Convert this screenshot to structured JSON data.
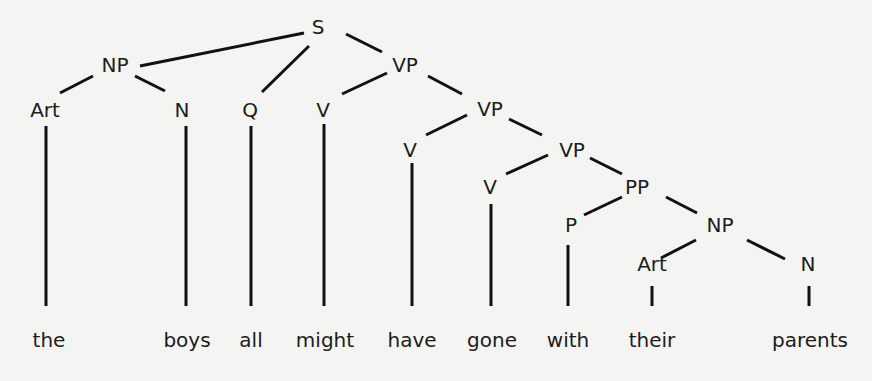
{
  "diagram": {
    "type": "syntax-tree",
    "sentence": "the boys all might have gone with their parents",
    "nodes": [
      {
        "id": "S",
        "label": "S",
        "x": 318,
        "y": 34
      },
      {
        "id": "NP1",
        "label": "NP",
        "x": 115,
        "y": 72
      },
      {
        "id": "VP1",
        "label": "VP",
        "x": 405,
        "y": 72
      },
      {
        "id": "Art1",
        "label": "Art",
        "x": 45,
        "y": 117
      },
      {
        "id": "N1",
        "label": "N",
        "x": 182,
        "y": 117
      },
      {
        "id": "Q",
        "label": "Q",
        "x": 250,
        "y": 117
      },
      {
        "id": "V1",
        "label": "V",
        "x": 323,
        "y": 117
      },
      {
        "id": "VP2",
        "label": "VP",
        "x": 490,
        "y": 116
      },
      {
        "id": "V2",
        "label": "V",
        "x": 410,
        "y": 157
      },
      {
        "id": "VP3",
        "label": "VP",
        "x": 572,
        "y": 157
      },
      {
        "id": "V3",
        "label": "V",
        "x": 490,
        "y": 194
      },
      {
        "id": "PP",
        "label": "PP",
        "x": 637,
        "y": 194
      },
      {
        "id": "P",
        "label": "P",
        "x": 571,
        "y": 232
      },
      {
        "id": "NP2",
        "label": "NP",
        "x": 720,
        "y": 232
      },
      {
        "id": "Art2",
        "label": "Art",
        "x": 652,
        "y": 271
      },
      {
        "id": "N2",
        "label": "N",
        "x": 808,
        "y": 271
      }
    ],
    "edges": [
      {
        "from": "S",
        "to": "NP1",
        "x1": 304,
        "y1": 33,
        "x2": 140,
        "y2": 66
      },
      {
        "from": "S",
        "to": "Q",
        "x1": 309,
        "y1": 46,
        "x2": 262,
        "y2": 92
      },
      {
        "from": "S",
        "to": "VP1",
        "x1": 346,
        "y1": 34,
        "x2": 382,
        "y2": 52
      },
      {
        "from": "NP1",
        "to": "Art1",
        "x1": 93,
        "y1": 76,
        "x2": 60,
        "y2": 93
      },
      {
        "from": "NP1",
        "to": "N1",
        "x1": 135,
        "y1": 76,
        "x2": 165,
        "y2": 91
      },
      {
        "from": "VP1",
        "to": "V1",
        "x1": 387,
        "y1": 73,
        "x2": 342,
        "y2": 94
      },
      {
        "from": "VP1",
        "to": "VP2",
        "x1": 428,
        "y1": 76,
        "x2": 462,
        "y2": 94
      },
      {
        "from": "VP2",
        "to": "V2",
        "x1": 467,
        "y1": 115,
        "x2": 426,
        "y2": 135
      },
      {
        "from": "VP2",
        "to": "VP3",
        "x1": 509,
        "y1": 119,
        "x2": 542,
        "y2": 135
      },
      {
        "from": "VP3",
        "to": "V3",
        "x1": 548,
        "y1": 155,
        "x2": 506,
        "y2": 174
      },
      {
        "from": "VP3",
        "to": "PP",
        "x1": 590,
        "y1": 158,
        "x2": 622,
        "y2": 174
      },
      {
        "from": "PP",
        "to": "P",
        "x1": 622,
        "y1": 197,
        "x2": 584,
        "y2": 215
      },
      {
        "from": "PP",
        "to": "NP2",
        "x1": 666,
        "y1": 197,
        "x2": 697,
        "y2": 213
      },
      {
        "from": "NP2",
        "to": "Art2",
        "x1": 696,
        "y1": 240,
        "x2": 661,
        "y2": 258
      },
      {
        "from": "NP2",
        "to": "N2",
        "x1": 747,
        "y1": 240,
        "x2": 785,
        "y2": 259
      },
      {
        "from": "Art1",
        "to": "the",
        "x1": 46,
        "y1": 126,
        "x2": 46,
        "y2": 306
      },
      {
        "from": "N1",
        "to": "boys",
        "x1": 186,
        "y1": 126,
        "x2": 186,
        "y2": 306
      },
      {
        "from": "Q",
        "to": "all",
        "x1": 251,
        "y1": 126,
        "x2": 251,
        "y2": 306
      },
      {
        "from": "V1",
        "to": "might",
        "x1": 324,
        "y1": 124,
        "x2": 324,
        "y2": 306
      },
      {
        "from": "V2",
        "to": "have",
        "x1": 412,
        "y1": 163,
        "x2": 412,
        "y2": 306
      },
      {
        "from": "V3",
        "to": "gone",
        "x1": 491,
        "y1": 204,
        "x2": 491,
        "y2": 306
      },
      {
        "from": "P",
        "to": "with",
        "x1": 568,
        "y1": 245,
        "x2": 568,
        "y2": 306
      },
      {
        "from": "Art2",
        "to": "their",
        "x1": 652,
        "y1": 286,
        "x2": 652,
        "y2": 306
      },
      {
        "from": "N2",
        "to": "parents",
        "x1": 809,
        "y1": 286,
        "x2": 809,
        "y2": 306
      }
    ],
    "words": [
      {
        "text": "the",
        "x": 49,
        "y": 347
      },
      {
        "text": "boys",
        "x": 187,
        "y": 347
      },
      {
        "text": "all",
        "x": 251,
        "y": 347
      },
      {
        "text": "might",
        "x": 325,
        "y": 347
      },
      {
        "text": "have",
        "x": 412,
        "y": 347
      },
      {
        "text": "gone",
        "x": 492,
        "y": 347
      },
      {
        "text": "with",
        "x": 568,
        "y": 347
      },
      {
        "text": "their",
        "x": 652,
        "y": 347
      },
      {
        "text": "parents",
        "x": 810,
        "y": 347
      }
    ]
  }
}
